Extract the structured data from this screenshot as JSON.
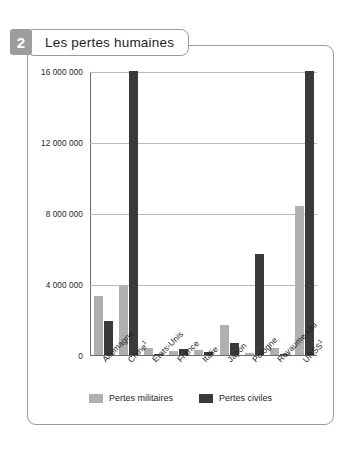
{
  "figure": {
    "badge_number": "2",
    "title": "Les pertes humaines"
  },
  "chart_data": {
    "type": "bar",
    "title": "Les pertes humaines",
    "xlabel": "",
    "ylabel": "",
    "ylim": [
      0,
      16000000
    ],
    "grid": true,
    "legend_position": "bottom",
    "ytick_labels": [
      "0",
      "4 000 000",
      "8 000 000",
      "12 000 000",
      "16 000 000"
    ],
    "ytick_values": [
      0,
      4000000,
      8000000,
      12000000,
      16000000
    ],
    "categories": [
      "Allemagne",
      "Chine",
      "États-Unis",
      "France",
      "Italie",
      "Japon",
      "Pologne",
      "Royaume-Uni",
      "URSS"
    ],
    "category_footnotes": [
      "",
      "1",
      "",
      "",
      "",
      "",
      "",
      "",
      "1"
    ],
    "series": [
      {
        "name": "Pertes militaires",
        "color": "#b0b0b0",
        "values": [
          3300000,
          3900000,
          400000,
          200000,
          300000,
          1700000,
          120000,
          400000,
          8400000
        ]
      },
      {
        "name": "Pertes civiles",
        "color": "#3a3a3a",
        "values": [
          1900000,
          16000000,
          20000,
          350000,
          150000,
          700000,
          5700000,
          70000,
          16000000
        ]
      }
    ]
  },
  "legend": [
    {
      "label": "Pertes militaires",
      "color": "#b0b0b0"
    },
    {
      "label": "Pertes civiles",
      "color": "#3a3a3a"
    }
  ]
}
